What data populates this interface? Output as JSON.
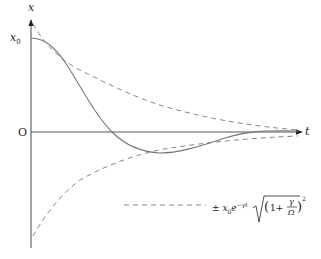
{
  "diagram": {
    "axes": {
      "x_label": "t",
      "y_label": "x",
      "origin_label": "O",
      "initial_value_label": "x0"
    },
    "curves": [
      {
        "name": "damped-oscillation",
        "style": "solid",
        "description": "x(t) starting at x0 with zero slope, crossing zero, small negative undershoot, decaying to zero"
      },
      {
        "name": "upper-envelope",
        "style": "dashed",
        "description": "+ x0 e^{-γt} sqrt((1+γ/Ω)^2)"
      },
      {
        "name": "lower-envelope",
        "style": "dashed",
        "description": "- x0 e^{-γt} sqrt((1+γ/Ω)^2)"
      }
    ],
    "legend": {
      "line_style": "dashed",
      "label": "± x₀e^{−γt} √((1 + γ/Ω)²)",
      "parts": {
        "pm": "±",
        "x0": "x",
        "x0_sub": "0",
        "e": "e",
        "exp": "−γt",
        "one_plus": "1+",
        "gamma": "γ",
        "omega": "Ω",
        "square": "2"
      }
    },
    "colors": {
      "axis": "#555555",
      "curve": "#777777",
      "envelope": "#888888",
      "text": "#222222"
    }
  }
}
